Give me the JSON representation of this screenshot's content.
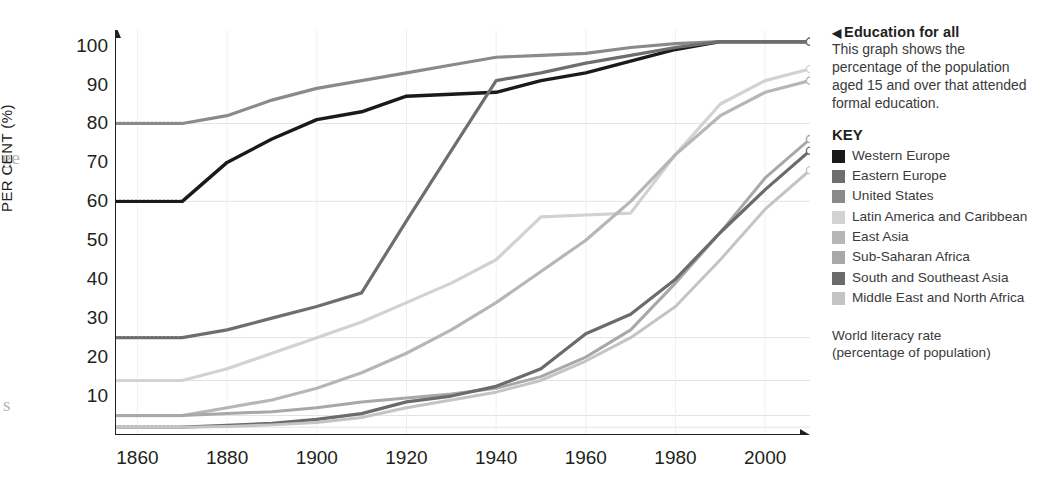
{
  "caption": {
    "marker": "◀",
    "title": "Education for all",
    "body": "This graph shows the percentage of the population aged 15 and over that attended formal education."
  },
  "key": {
    "heading": "KEY",
    "items": [
      {
        "label": "Western Europe",
        "color": "#1a1a1a"
      },
      {
        "label": "Eastern Europe",
        "color": "#6e6e6e"
      },
      {
        "label": "United States",
        "color": "#8a8a8a"
      },
      {
        "label": "Latin America and Caribbean",
        "color": "#d2d2d2"
      },
      {
        "label": "East Asia",
        "color": "#b6b6b6"
      },
      {
        "label": "Sub-Saharan Africa",
        "color": "#a8a8a8"
      },
      {
        "label": "South and Southeast Asia",
        "color": "#6b6b6b"
      },
      {
        "label": "Middle East and North Africa",
        "color": "#c4c4c4"
      }
    ]
  },
  "footer": {
    "line1": "World literacy rate",
    "line2": "(percentage of population)"
  },
  "chart_data": {
    "type": "line",
    "title": "Education for all",
    "xlabel": "",
    "ylabel": "PER CENT (%)",
    "xlim": [
      1855,
      2010
    ],
    "ylim": [
      0,
      104
    ],
    "grid": true,
    "legend_position": "right",
    "x_ticks": [
      1860,
      1880,
      1900,
      1920,
      1940,
      1960,
      1980,
      2000
    ],
    "y_ticks": [
      10,
      20,
      30,
      40,
      50,
      60,
      70,
      80,
      90,
      100
    ],
    "endpoint_markers": true,
    "series": [
      {
        "name": "Western Europe",
        "color": "#1a1a1a",
        "width": 3.4,
        "lead_in": {
          "x": 1855,
          "y": 60
        },
        "x": [
          1870,
          1880,
          1890,
          1900,
          1910,
          1920,
          1930,
          1940,
          1950,
          1960,
          1970,
          1980,
          1990,
          2000,
          2010
        ],
        "y": [
          60,
          70,
          76,
          81,
          83,
          87,
          87.5,
          88,
          91,
          93,
          96,
          99,
          101,
          101,
          101
        ]
      },
      {
        "name": "United States",
        "color": "#8a8a8a",
        "width": 3.2,
        "lead_in": {
          "x": 1855,
          "y": 80
        },
        "x": [
          1870,
          1880,
          1890,
          1900,
          1910,
          1920,
          1930,
          1940,
          1950,
          1960,
          1970,
          1980,
          1990,
          2000,
          2010
        ],
        "y": [
          80,
          82,
          86,
          89,
          91,
          93,
          95,
          97,
          97.5,
          98,
          99.5,
          100.5,
          101,
          101,
          101
        ]
      },
      {
        "name": "Eastern Europe",
        "color": "#6e6e6e",
        "width": 3.2,
        "lead_in": {
          "x": 1855,
          "y": 25
        },
        "x": [
          1870,
          1880,
          1890,
          1900,
          1910,
          1920,
          1930,
          1940,
          1950,
          1960,
          1970,
          1980,
          1990,
          2000,
          2010
        ],
        "y": [
          25,
          27,
          30,
          33,
          36.5,
          55,
          73,
          91,
          93,
          95.5,
          97.5,
          99.5,
          101,
          101,
          101
        ]
      },
      {
        "name": "Latin America and Caribbean",
        "color": "#d2d2d2",
        "width": 3.2,
        "lead_in": {
          "x": 1855,
          "y": 14
        },
        "x": [
          1870,
          1880,
          1890,
          1900,
          1910,
          1920,
          1930,
          1940,
          1950,
          1960,
          1970,
          1980,
          1990,
          2000,
          2010
        ],
        "y": [
          14,
          17,
          21,
          25,
          29,
          34,
          39,
          45,
          56,
          56.5,
          57,
          72,
          85,
          91,
          94
        ]
      },
      {
        "name": "East Asia",
        "color": "#b6b6b6",
        "width": 3.2,
        "lead_in": {
          "x": 1855,
          "y": 5
        },
        "x": [
          1870,
          1880,
          1890,
          1900,
          1910,
          1920,
          1930,
          1940,
          1950,
          1960,
          1970,
          1980,
          1990,
          2000,
          2010
        ],
        "y": [
          5,
          7,
          9,
          12,
          16,
          21,
          27,
          34,
          42,
          50,
          60,
          72,
          82,
          88,
          91
        ]
      },
      {
        "name": "Sub-Saharan Africa",
        "color": "#a8a8a8",
        "width": 3.0,
        "lead_in": {
          "x": 1855,
          "y": 5
        },
        "x": [
          1870,
          1880,
          1890,
          1900,
          1910,
          1920,
          1930,
          1940,
          1950,
          1960,
          1970,
          1980,
          1990,
          2000,
          2010
        ],
        "y": [
          5,
          5.5,
          6,
          7,
          8.5,
          9.5,
          10.5,
          12,
          15,
          20,
          27,
          39,
          52,
          66,
          76
        ]
      },
      {
        "name": "South and Southeast Asia",
        "color": "#6b6b6b",
        "width": 3.2,
        "lead_in": {
          "x": 1855,
          "y": 2
        },
        "x": [
          1870,
          1880,
          1890,
          1900,
          1910,
          1920,
          1930,
          1940,
          1950,
          1960,
          1970,
          1980,
          1990,
          2000,
          2010
        ],
        "y": [
          2,
          2.5,
          3,
          4,
          5.5,
          8.5,
          10,
          12.5,
          17,
          26,
          31,
          40,
          52,
          63,
          73
        ]
      },
      {
        "name": "Middle East and North Africa",
        "color": "#c4c4c4",
        "width": 3.0,
        "lead_in": {
          "x": 1855,
          "y": 2
        },
        "x": [
          1870,
          1880,
          1890,
          1900,
          1910,
          1920,
          1930,
          1940,
          1950,
          1960,
          1970,
          1980,
          1990,
          2000,
          2010
        ],
        "y": [
          2,
          2.2,
          2.6,
          3.2,
          4.5,
          7,
          9,
          11,
          14,
          19,
          25,
          33,
          45,
          58,
          68
        ]
      }
    ],
    "gridline_values": [
      80,
      60,
      25,
      14,
      5,
      2
    ]
  },
  "bleed_text": {
    "frag1": "ge",
    "frag2": "s"
  }
}
